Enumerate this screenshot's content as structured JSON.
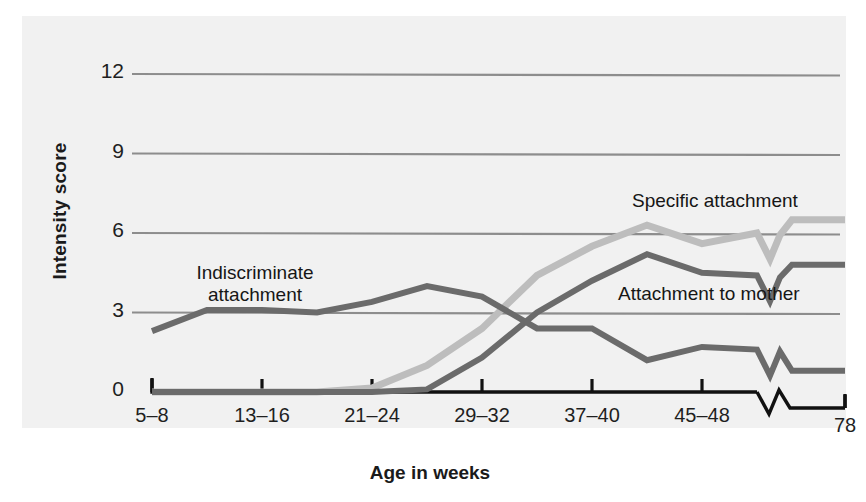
{
  "figure": {
    "background": "#f1f1f1",
    "page_background": "#ffffff"
  },
  "axis": {
    "y_title": "Intensity score",
    "x_title": "Age in weeks",
    "y_ticks": [
      "0",
      "3",
      "6",
      "9",
      "12"
    ],
    "x_ticks": [
      "5–8",
      "13–16",
      "21–24",
      "29–32",
      "37–40",
      "45–48",
      "78"
    ],
    "axis_break": true,
    "axis_color": "#111111",
    "grid_color": "#8d8d8d"
  },
  "annotations": {
    "indiscriminate_line1": "Indiscriminate",
    "indiscriminate_line2": "attachment",
    "specific": "Specific attachment",
    "mother": "Attachment to mother"
  },
  "colors": {
    "specific_attachment": "#bdbdbd",
    "attachment_to_mother": "#6b6b6b",
    "indiscriminate_attachment": "#6b6b6b"
  },
  "chart_data": {
    "type": "line",
    "title": "",
    "xlabel": "Age in weeks",
    "ylabel": "Intensity score",
    "ylim": [
      0,
      13
    ],
    "grid": true,
    "legend": "inline-annotations",
    "categories": [
      "5–8",
      "9–12",
      "13–16",
      "17–20",
      "21–24",
      "25–28",
      "29–32",
      "33–36",
      "37–40",
      "41–44",
      "45–48",
      "49–52",
      "78"
    ],
    "series": [
      {
        "name": "Indiscriminate attachment",
        "color": "#6b6b6b",
        "values": [
          2.3,
          3.1,
          3.1,
          3.0,
          3.4,
          4.0,
          3.6,
          2.4,
          2.4,
          1.2,
          1.7,
          1.6,
          0.8
        ]
      },
      {
        "name": "Specific attachment",
        "color": "#bdbdbd",
        "values": [
          0,
          0,
          0,
          0,
          0.15,
          1.0,
          2.4,
          4.4,
          5.5,
          6.3,
          5.6,
          6.0,
          6.5
        ]
      },
      {
        "name": "Attachment to mother",
        "color": "#6b6b6b",
        "values": [
          0,
          0,
          0,
          0,
          0,
          0.1,
          1.3,
          3.0,
          4.2,
          5.2,
          4.5,
          4.4,
          4.8
        ]
      }
    ]
  }
}
